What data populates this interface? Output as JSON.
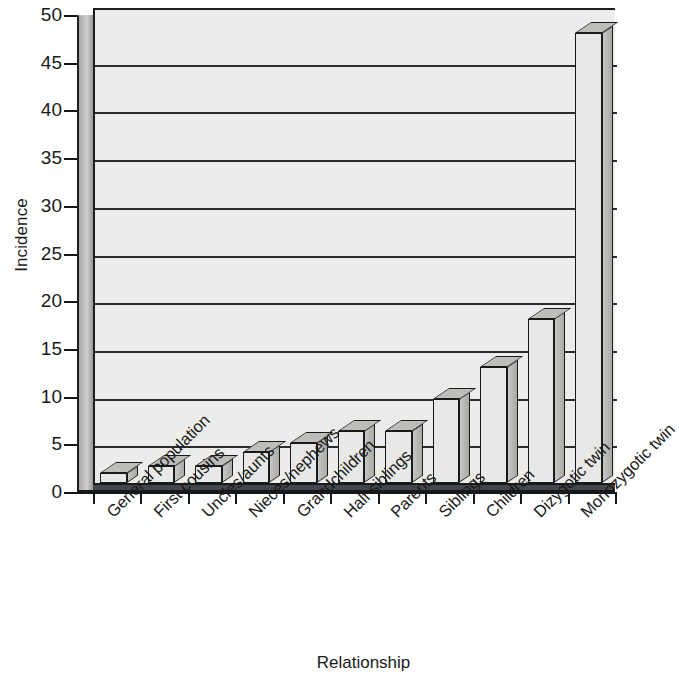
{
  "chart_data": {
    "type": "bar",
    "title": "",
    "xlabel": "Relationship",
    "ylabel": "Incidence",
    "ylim": [
      0,
      50
    ],
    "ytick_step": 5,
    "yticks": [
      50,
      45,
      40,
      35,
      30,
      25,
      20,
      15,
      10,
      5,
      0
    ],
    "grid": true,
    "legend": false,
    "style": "3d-bar",
    "categories": [
      "General population",
      "First cousins",
      "Uncles/aunts",
      "Nieces/nephews",
      "Grandchildren",
      "Half siblings",
      "Parents",
      "Siblings",
      "Children",
      "Dizygotic twin",
      "Monozygotic twin"
    ],
    "values": [
      1,
      1.8,
      1.8,
      3.2,
      4.2,
      5.5,
      5.5,
      8.8,
      12.2,
      17.2,
      47.2
    ],
    "series": [
      {
        "name": "Incidence",
        "values": [
          1,
          1.8,
          1.8,
          3.2,
          4.2,
          5.5,
          5.5,
          8.8,
          12.2,
          17.2,
          47.2
        ]
      }
    ]
  },
  "colors": {
    "bar_front": "#e8e8e6",
    "bar_side": "#b4b4b1",
    "bar_top": "#bdbdba",
    "plot_background": "#ececeb",
    "axis": "#15181a",
    "gridline": "#2a2c2e",
    "floor": "#43464a",
    "text": "#1a1a1a"
  }
}
